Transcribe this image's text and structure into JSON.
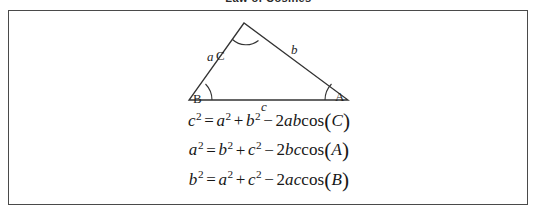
{
  "title": "Law of Cosines",
  "figure": {
    "triangle": {
      "vertices": [
        {
          "name": "C",
          "label": "C",
          "x": 235,
          "y": 12,
          "role": "apex"
        },
        {
          "name": "B",
          "label": "B",
          "x": 180,
          "y": 89,
          "role": "bottom-left"
        },
        {
          "name": "A",
          "label": "A",
          "x": 339,
          "y": 89,
          "role": "bottom-right"
        }
      ],
      "sides": [
        {
          "name": "a",
          "label": "a",
          "between": "B-C"
        },
        {
          "name": "b",
          "label": "b",
          "between": "C-A"
        },
        {
          "name": "c",
          "label": "c",
          "between": "B-A"
        }
      ],
      "angle_marks": [
        "C",
        "B",
        "A"
      ],
      "stroke_color": "#333333"
    }
  },
  "equations": [
    {
      "id": "law-of-cosines-c",
      "text": "c² = a² + b² − 2ab cos(C)",
      "left": {
        "var": "c",
        "exp": "2"
      },
      "terms": [
        {
          "var": "a",
          "exp": "2",
          "op": "="
        },
        {
          "var": "b",
          "exp": "2",
          "op": "+"
        }
      ],
      "product": {
        "op": "−",
        "coefficient": "2",
        "factors": "ab",
        "fn": "cos",
        "arg": "C"
      }
    },
    {
      "id": "law-of-cosines-a",
      "text": "a² = b² + c² − 2bc cos(A)",
      "left": {
        "var": "a",
        "exp": "2"
      },
      "terms": [
        {
          "var": "b",
          "exp": "2",
          "op": "="
        },
        {
          "var": "c",
          "exp": "2",
          "op": "+"
        }
      ],
      "product": {
        "op": "−",
        "coefficient": "2",
        "factors": "bc",
        "fn": "cos",
        "arg": "A"
      }
    },
    {
      "id": "law-of-cosines-b",
      "text": "b² = a² + c² − 2ac cos(B)",
      "left": {
        "var": "b",
        "exp": "2"
      },
      "terms": [
        {
          "var": "a",
          "exp": "2",
          "op": "="
        },
        {
          "var": "c",
          "exp": "2",
          "op": "+"
        }
      ],
      "product": {
        "op": "−",
        "coefficient": "2",
        "factors": "ac",
        "fn": "cos",
        "arg": "B"
      }
    }
  ],
  "colors": {
    "border": "#4a4a4a",
    "ink": "#1a1a1a",
    "background": "#ffffff"
  }
}
